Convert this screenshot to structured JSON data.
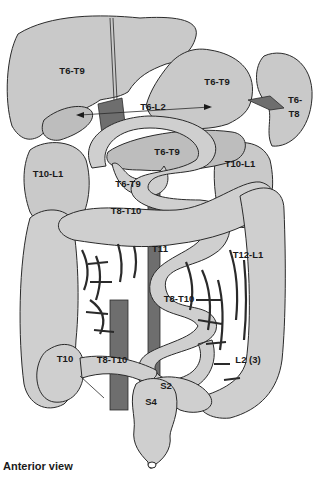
{
  "figure": {
    "view_caption": "Anterior view",
    "colors": {
      "organ_fill": "#c9c9c9",
      "vessel_fill": "#6e6e6e",
      "outline": "#2a2a2a",
      "background": "#ffffff"
    },
    "labels": {
      "liver": "T6-T9",
      "stomach": "T6-T9",
      "spleen_line1": "T6-",
      "spleen_line2": "T8",
      "gallbladder_to_stomach_arrow": "T6-L2",
      "pancreas": "T6-T9",
      "duodenum": "T6-T9",
      "kidney_right": "T10-L1",
      "kidney_left": "T10-L1",
      "small_intestine_upper": "T8-T10",
      "transverse_colon": "T11",
      "descending_colon_upper": "T12-L1",
      "small_intestine_mid": "T8-T10",
      "cecum": "T10",
      "ileum": "T8-T10",
      "sigmoid": "L2 (3)",
      "sigmoid_s2": "S2",
      "rectum": "S4"
    }
  }
}
